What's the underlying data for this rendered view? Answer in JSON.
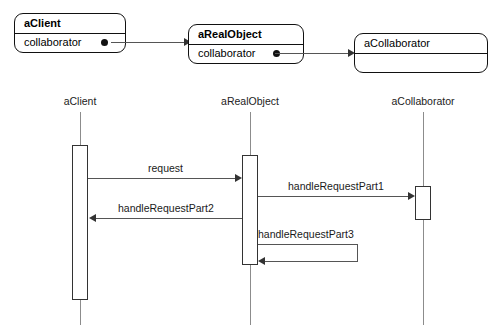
{
  "diagram": {
    "colors": {
      "box_border": "#111111",
      "line": "#555555",
      "lifeline": "#8c8c8c",
      "activation_border": "#333333",
      "background": "#ffffff",
      "text": "#000000"
    }
  },
  "collaboration": {
    "objects": [
      {
        "name": "aClient",
        "bold": true,
        "attribute": "collaborator",
        "has_reference_dot": true
      },
      {
        "name": "aRealObject",
        "bold": true,
        "attribute": "collaborator",
        "has_reference_dot": true
      },
      {
        "name": "aCollaborator",
        "bold": false,
        "attribute": "",
        "has_reference_dot": false
      }
    ],
    "links": [
      {
        "from": "aClient",
        "to": "aRealObject"
      },
      {
        "from": "aRealObject",
        "to": "aCollaborator"
      }
    ]
  },
  "sequence": {
    "lifelines": [
      {
        "label": "aClient"
      },
      {
        "label": "aRealObject"
      },
      {
        "label": "aCollaborator"
      }
    ],
    "messages": [
      {
        "label": "request",
        "from": "aClient",
        "to": "aRealObject",
        "direction": "right"
      },
      {
        "label": "handleRequestPart1",
        "from": "aRealObject",
        "to": "aCollaborator",
        "direction": "right"
      },
      {
        "label": "handleRequestPart2",
        "from": "aRealObject",
        "to": "aClient",
        "direction": "left"
      },
      {
        "label": "handleRequestPart3",
        "from": "aRealObject",
        "to": "aRealObject",
        "direction": "self"
      }
    ]
  }
}
